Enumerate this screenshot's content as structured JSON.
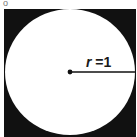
{
  "figure": {
    "square": {
      "color": "#111111"
    },
    "circle": {
      "fill": "#ffffff"
    },
    "radius_label": {
      "variable": "r",
      "equals": " =1"
    },
    "corner_mark": "o"
  }
}
